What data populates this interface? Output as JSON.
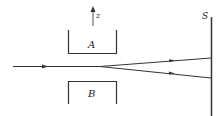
{
  "diagram": {
    "labels": {
      "magnet_top": "A",
      "magnet_bottom": "B",
      "axis": "z",
      "screen": "S"
    },
    "colors": {
      "line": "#333333",
      "background": "#ffffff"
    },
    "beam": {
      "incoming_y": 66,
      "split_x": 100,
      "upper_hit_y": 58,
      "lower_hit_y": 78
    }
  }
}
